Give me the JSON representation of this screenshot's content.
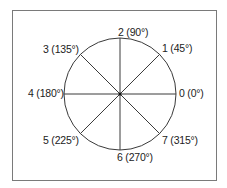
{
  "diagram": {
    "title": "",
    "center": {
      "x": 120,
      "y": 94
    },
    "radius": 56,
    "line_color": "#3a3a3a",
    "frame_color": "#7a7a7a",
    "directions": [
      {
        "index": 0,
        "angle": 0,
        "label": "0 (0°)"
      },
      {
        "index": 1,
        "angle": 45,
        "label": "1 (45°)"
      },
      {
        "index": 2,
        "angle": 90,
        "label": "2 (90°)"
      },
      {
        "index": 3,
        "angle": 135,
        "label": "3 (135°)"
      },
      {
        "index": 4,
        "angle": 180,
        "label": "4 (180°)"
      },
      {
        "index": 5,
        "angle": 225,
        "label": "5 (225°)"
      },
      {
        "index": 6,
        "angle": 270,
        "label": "6 (270°)"
      },
      {
        "index": 7,
        "angle": 315,
        "label": "7 (315°)"
      }
    ]
  }
}
